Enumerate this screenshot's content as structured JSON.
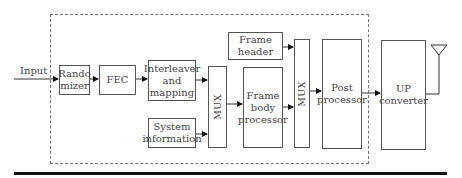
{
  "diagram": {
    "input_label": "Input",
    "blocks": {
      "randomizer": "Rando\nmizer",
      "fec": "FEC",
      "interleaver": "Interleaver\nand\nmapping",
      "system_info": "System\ninformation",
      "mux1": "MUX",
      "frame_header": "Frame\nheader",
      "frame_body": "Frame\nbody\nprocessor",
      "mux2": "MUX",
      "post_processor": "Post\nprocessor",
      "up_converter": "UP\nconverter"
    },
    "antenna": "antenna-icon"
  }
}
